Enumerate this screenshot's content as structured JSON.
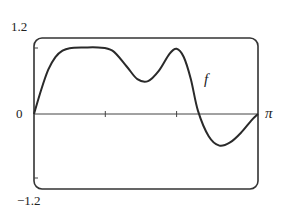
{
  "chart_data": {
    "type": "line",
    "title": "",
    "xlabel": "",
    "ylabel": "",
    "xlim": [
      0,
      3.14159
    ],
    "ylim": [
      -1.2,
      1.2
    ],
    "x_ticks": [
      1,
      2
    ],
    "x_tick_labels": {
      "right_end": "π"
    },
    "y_tick_labels": {
      "top": "1.2",
      "zero": "0",
      "bottom": "-1.2"
    },
    "grid": false,
    "legend": "none",
    "annotations": [
      {
        "text": "f",
        "x": 2.05,
        "y": 0.45
      }
    ],
    "series": [
      {
        "name": "f",
        "x": [
          0,
          0.1,
          0.2,
          0.3,
          0.4,
          0.5,
          0.7,
          0.9,
          1.1,
          1.3,
          1.45,
          1.6,
          1.75,
          1.9,
          2.0,
          2.1,
          2.2,
          2.3,
          2.45,
          2.6,
          2.75,
          2.9,
          3.05,
          3.14159
        ],
        "y": [
          0,
          0.38,
          0.7,
          0.9,
          1.0,
          1.04,
          1.05,
          1.05,
          1.0,
          0.75,
          0.55,
          0.52,
          0.68,
          0.95,
          1.03,
          0.9,
          0.55,
          0.05,
          -0.35,
          -0.5,
          -0.45,
          -0.3,
          -0.1,
          0
        ]
      }
    ]
  },
  "labels": {
    "y_top": "1.2",
    "y_zero": "0",
    "y_bottom": "−1.2",
    "x_end": "π",
    "curve": "f"
  },
  "colors": {
    "line": "#2a2a2a",
    "frame": "#333333",
    "background": "#ffffff"
  }
}
